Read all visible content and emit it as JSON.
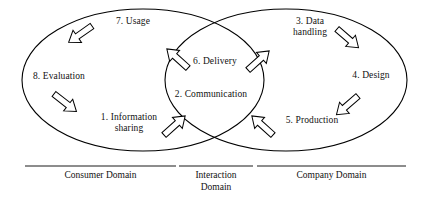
{
  "figure": {
    "type": "venn-cycle-diagram",
    "background_color": "#ffffff",
    "stroke_color": "#000000",
    "text_color": "#111111"
  },
  "nodes": [
    {
      "id": "usage",
      "label": "7. Usage",
      "x": 105,
      "y": 16,
      "w": 56,
      "align": "center"
    },
    {
      "id": "evaluation",
      "label": "8. Evaluation",
      "x": 22,
      "y": 71,
      "w": 74,
      "align": "center"
    },
    {
      "id": "information",
      "label": "1. Information\nsharing",
      "x": 96,
      "y": 112,
      "w": 66,
      "align": "center"
    },
    {
      "id": "delivery",
      "label": "6. Delivery",
      "x": 184,
      "y": 56,
      "w": 62,
      "align": "center"
    },
    {
      "id": "communication",
      "label": "2. Communication",
      "x": 163,
      "y": 89,
      "w": 96,
      "align": "center"
    },
    {
      "id": "data-handling",
      "label": "3. Data\nhandling",
      "x": 284,
      "y": 16,
      "w": 52,
      "align": "center"
    },
    {
      "id": "design",
      "label": "4. Design",
      "x": 345,
      "y": 70,
      "w": 52,
      "align": "center"
    },
    {
      "id": "production",
      "label": "5. Production",
      "x": 276,
      "y": 115,
      "w": 72,
      "align": "center"
    }
  ],
  "ellipses": [
    {
      "id": "consumer-domain-ellipse",
      "cx": 143,
      "cy": 80,
      "rx": 121,
      "ry": 71
    },
    {
      "id": "company-domain-ellipse",
      "cx": 286,
      "cy": 80,
      "rx": 121,
      "ry": 71
    }
  ],
  "arrows": [
    {
      "id": "usage-to-evaluation",
      "from": "usage",
      "to": "evaluation",
      "direction": "down-left"
    },
    {
      "id": "evaluation-to-information",
      "from": "evaluation",
      "to": "information",
      "direction": "down-right"
    },
    {
      "id": "information-to-communication",
      "from": "information",
      "to": "communication",
      "direction": "up-right"
    },
    {
      "id": "production-to-communication",
      "from": "production",
      "to": "communication",
      "direction": "up-left"
    },
    {
      "id": "delivery-to-datahandling",
      "from": "delivery",
      "to": "data-handling",
      "direction": "up-right"
    },
    {
      "id": "delivery-to-usage",
      "from": "delivery",
      "to": "usage",
      "direction": "up-left"
    },
    {
      "id": "datahandling-to-design",
      "from": "data-handling",
      "to": "design",
      "direction": "down-right"
    },
    {
      "id": "design-to-production",
      "from": "design",
      "to": "production",
      "direction": "down-left"
    }
  ],
  "domains": [
    {
      "id": "consumer-domain",
      "label": "Consumer Domain",
      "rule": {
        "x1": 25,
        "x2": 176,
        "y": 166
      },
      "text_x": 25,
      "text_y": 170,
      "text_w": 151
    },
    {
      "id": "interaction-domain",
      "label": "Interaction\nDomain",
      "rule": {
        "x1": 179,
        "x2": 253,
        "y": 166
      },
      "text_x": 179,
      "text_y": 170,
      "text_w": 74
    },
    {
      "id": "company-domain",
      "label": "Company Domain",
      "rule": {
        "x1": 257,
        "x2": 406,
        "y": 166
      },
      "text_x": 257,
      "text_y": 170,
      "text_w": 149
    }
  ]
}
